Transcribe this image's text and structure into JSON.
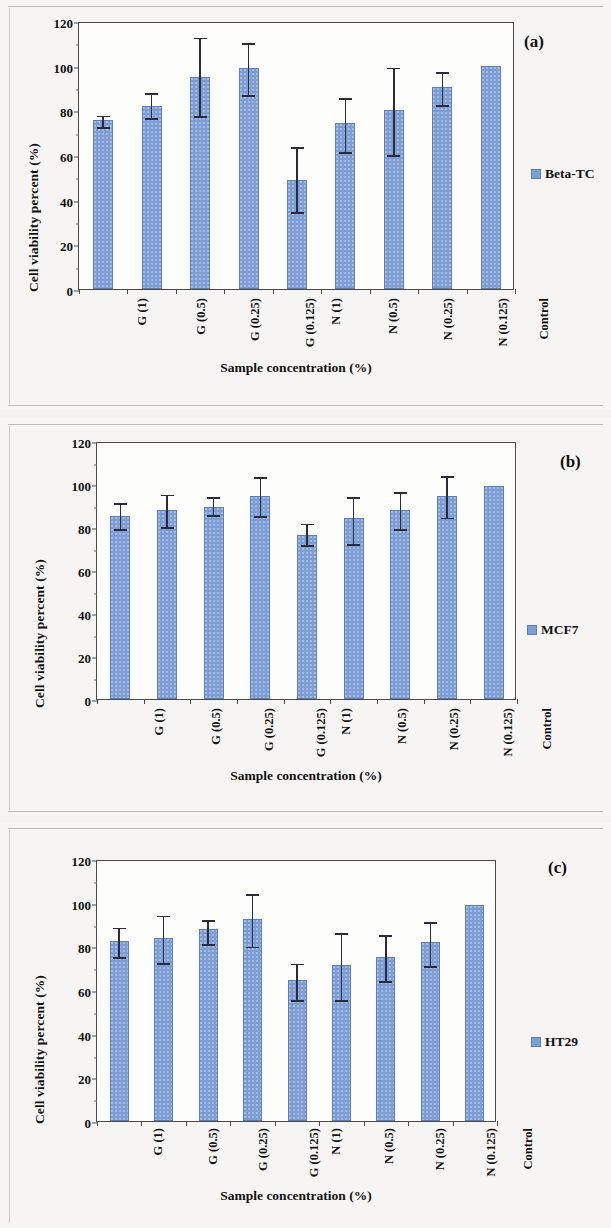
{
  "figure": {
    "background_color": "#f3f2f0",
    "bar_color": "#7e9fd6",
    "bar_edge_color": "#5f7fbc",
    "error_bar_color": "#2b2b3a",
    "axis_color": "#4a4a4a"
  },
  "axes_common": {
    "ylabel": "Cell viability percent (%)",
    "xlabel": "Sample concentration (%)",
    "yticks": [
      0,
      20,
      40,
      60,
      80,
      100,
      120
    ],
    "ylim": [
      0,
      120
    ],
    "categories": [
      "G (1)",
      "G (0.5)",
      "G (0.25)",
      "G (0.125)",
      "N (1)",
      "N (0.5)",
      "N (0.25)",
      "N (0.125)",
      "Control"
    ]
  },
  "panels": [
    {
      "letter": "(a)",
      "legend_label": "Beta-TC"
    },
    {
      "letter": "(b)",
      "legend_label": "MCF7"
    },
    {
      "letter": "(c)",
      "legend_label": "HT29"
    }
  ],
  "chart_data": [
    {
      "type": "bar",
      "title": "(a)",
      "xlabel": "Sample concentration (%)",
      "ylabel": "Cell viability percent (%)",
      "ylim": [
        0,
        120
      ],
      "yticks": [
        0,
        20,
        40,
        60,
        80,
        100,
        120
      ],
      "grid": false,
      "legend_position": "right",
      "categories": [
        "G (1)",
        "G (0.5)",
        "G (0.25)",
        "G (0.125)",
        "N (1)",
        "N (0.5)",
        "N (0.25)",
        "N (0.125)",
        "Control"
      ],
      "series": [
        {
          "name": "Beta-TC",
          "values": [
            75.5,
            82,
            95,
            99,
            49,
            74.5,
            80,
            90.5,
            100
          ],
          "error_low": [
            3,
            5.5,
            17.5,
            12,
            14.5,
            13,
            20,
            8,
            0
          ],
          "error_high": [
            3,
            6.5,
            18.5,
            12,
            15.5,
            12,
            20,
            7.5,
            0
          ]
        }
      ]
    },
    {
      "type": "bar",
      "title": "(b)",
      "xlabel": "Sample concentration (%)",
      "ylabel": "Cell viability percent (%)",
      "ylim": [
        0,
        120
      ],
      "yticks": [
        0,
        20,
        40,
        60,
        80,
        100,
        120
      ],
      "grid": false,
      "legend_position": "right",
      "categories": [
        "G (1)",
        "G (0.5)",
        "G (0.25)",
        "G (0.125)",
        "N (1)",
        "N (0.5)",
        "N (0.25)",
        "N (0.125)",
        "Control"
      ],
      "series": [
        {
          "name": "MCF7",
          "values": [
            85,
            88,
            89.5,
            94.5,
            76.5,
            84,
            88,
            94.5,
            99
          ],
          "error_low": [
            6,
            8,
            4,
            9.5,
            5,
            12,
            9,
            10,
            0
          ],
          "error_high": [
            7,
            8,
            5.5,
            9.5,
            6,
            11,
            9,
            10,
            0
          ]
        }
      ]
    },
    {
      "type": "bar",
      "title": "(c)",
      "xlabel": "Sample concentration (%)",
      "ylabel": "Cell viability percent (%)",
      "ylim": [
        0,
        120
      ],
      "yticks": [
        0,
        20,
        40,
        60,
        80,
        100,
        120
      ],
      "grid": false,
      "legend_position": "right",
      "categories": [
        "G (1)",
        "G (0.5)",
        "G (0.25)",
        "G (0.125)",
        "N (1)",
        "N (0.5)",
        "N (0.25)",
        "N (0.125)",
        "Control"
      ],
      "series": [
        {
          "name": "HT29",
          "values": [
            82.5,
            84,
            88,
            92.5,
            64.5,
            71.5,
            75,
            82,
            99
          ],
          "error_low": [
            7.5,
            11.5,
            7,
            12.5,
            9,
            16,
            11,
            11,
            0
          ],
          "error_high": [
            7,
            11,
            5,
            12.5,
            8.5,
            15.5,
            11,
            10,
            0
          ]
        }
      ]
    }
  ]
}
